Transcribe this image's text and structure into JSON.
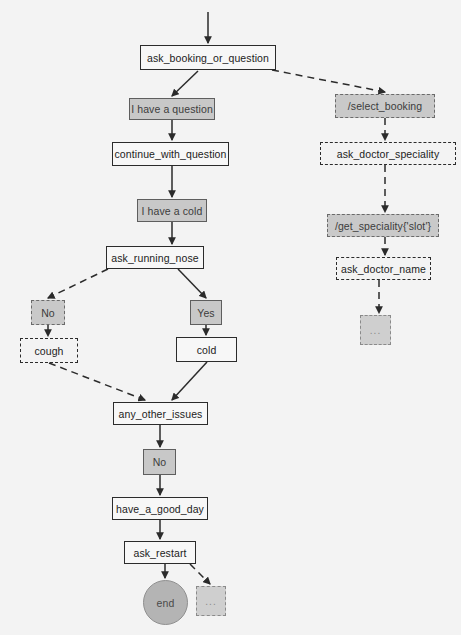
{
  "diagram": {
    "type": "flowchart",
    "background_color": "#f3f3f3",
    "node_fill_gray": "#c8c8c8",
    "node_fill_white": "#f7f7f7",
    "edge_color": "#2b2b2b",
    "nodes": [
      {
        "id": "ask_booking_or_question",
        "label": "ask_booking_or_question",
        "style": "solid-white",
        "x": 140,
        "y": 45,
        "w": 136,
        "h": 25
      },
      {
        "id": "i_have_a_question",
        "label": "I have a question",
        "style": "solid-gray",
        "x": 129,
        "y": 98,
        "w": 86,
        "h": 22
      },
      {
        "id": "continue_with_question",
        "label": "continue_with_question",
        "style": "solid-white",
        "x": 112,
        "y": 142,
        "w": 117,
        "h": 24
      },
      {
        "id": "i_have_a_cold",
        "label": "I have a cold",
        "style": "solid-gray",
        "x": 137,
        "y": 199,
        "w": 70,
        "h": 23
      },
      {
        "id": "ask_running_nose",
        "label": "ask_running_nose",
        "style": "solid-white",
        "x": 106,
        "y": 246,
        "w": 98,
        "h": 23
      },
      {
        "id": "no_left",
        "label": "No",
        "style": "dashed-gray",
        "x": 31,
        "y": 300,
        "w": 34,
        "h": 25
      },
      {
        "id": "cough",
        "label": "cough",
        "style": "dashed-white",
        "x": 20,
        "y": 338,
        "w": 58,
        "h": 25
      },
      {
        "id": "yes",
        "label": "Yes",
        "style": "solid-gray",
        "x": 190,
        "y": 300,
        "w": 32,
        "h": 25
      },
      {
        "id": "cold",
        "label": "cold",
        "style": "solid-white",
        "x": 176,
        "y": 337,
        "w": 61,
        "h": 25
      },
      {
        "id": "any_other_issues",
        "label": "any_other_issues",
        "style": "solid-white",
        "x": 113,
        "y": 402,
        "w": 95,
        "h": 23
      },
      {
        "id": "no_middle",
        "label": "No",
        "style": "solid-gray",
        "x": 143,
        "y": 449,
        "w": 33,
        "h": 26
      },
      {
        "id": "have_a_good_day",
        "label": "have_a_good_day",
        "style": "solid-white",
        "x": 112,
        "y": 497,
        "w": 96,
        "h": 23
      },
      {
        "id": "ask_restart",
        "label": "ask_restart",
        "style": "solid-white",
        "x": 124,
        "y": 541,
        "w": 72,
        "h": 23
      },
      {
        "id": "end",
        "label": "end",
        "style": "terminal",
        "x": 143,
        "y": 580,
        "w": 45,
        "h": 45
      },
      {
        "id": "end_ellipsis",
        "label": "...",
        "style": "ellipsis",
        "x": 196,
        "y": 586,
        "w": 30,
        "h": 30
      },
      {
        "id": "select_booking",
        "label": "/select_booking",
        "style": "dashed-gray",
        "x": 335,
        "y": 94,
        "w": 100,
        "h": 24
      },
      {
        "id": "ask_doctor_speciality",
        "label": "ask_doctor_speciality",
        "style": "dashed-white",
        "x": 320,
        "y": 142,
        "w": 136,
        "h": 23
      },
      {
        "id": "get_speciality_slot",
        "label": "/get_speciality{'slot'}",
        "style": "dashed-gray",
        "x": 327,
        "y": 214,
        "w": 112,
        "h": 23
      },
      {
        "id": "ask_doctor_name",
        "label": "ask_doctor_name",
        "style": "dashed-white",
        "x": 336,
        "y": 257,
        "w": 95,
        "h": 23
      },
      {
        "id": "right_ellipsis",
        "label": "...",
        "style": "ellipsis",
        "x": 360,
        "y": 315,
        "w": 31,
        "h": 30
      }
    ],
    "edges": [
      {
        "from": "start",
        "to": "ask_booking_or_question",
        "style": "solid"
      },
      {
        "from": "ask_booking_or_question",
        "to": "i_have_a_question",
        "style": "solid"
      },
      {
        "from": "ask_booking_or_question",
        "to": "select_booking",
        "style": "dashed"
      },
      {
        "from": "i_have_a_question",
        "to": "continue_with_question",
        "style": "solid"
      },
      {
        "from": "continue_with_question",
        "to": "i_have_a_cold",
        "style": "solid"
      },
      {
        "from": "i_have_a_cold",
        "to": "ask_running_nose",
        "style": "solid"
      },
      {
        "from": "ask_running_nose",
        "to": "no_left",
        "style": "dashed"
      },
      {
        "from": "ask_running_nose",
        "to": "yes",
        "style": "solid"
      },
      {
        "from": "no_left",
        "to": "cough",
        "style": "dashed"
      },
      {
        "from": "cough",
        "to": "any_other_issues",
        "style": "dashed"
      },
      {
        "from": "yes",
        "to": "cold",
        "style": "solid"
      },
      {
        "from": "cold",
        "to": "any_other_issues",
        "style": "solid"
      },
      {
        "from": "any_other_issues",
        "to": "no_middle",
        "style": "solid"
      },
      {
        "from": "no_middle",
        "to": "have_a_good_day",
        "style": "solid"
      },
      {
        "from": "have_a_good_day",
        "to": "ask_restart",
        "style": "solid"
      },
      {
        "from": "ask_restart",
        "to": "end",
        "style": "solid"
      },
      {
        "from": "ask_restart",
        "to": "end_ellipsis",
        "style": "dashed"
      },
      {
        "from": "select_booking",
        "to": "ask_doctor_speciality",
        "style": "dashed"
      },
      {
        "from": "ask_doctor_speciality",
        "to": "get_speciality_slot",
        "style": "dashed"
      },
      {
        "from": "get_speciality_slot",
        "to": "ask_doctor_name",
        "style": "dashed"
      },
      {
        "from": "ask_doctor_name",
        "to": "right_ellipsis",
        "style": "dashed"
      }
    ]
  },
  "background": {
    "ghost_text": "                                                                                                                                                                              \n                                                                                                                                                                              \n                                                                                                                                                                              \n                                                                                                                                                                              "
  }
}
